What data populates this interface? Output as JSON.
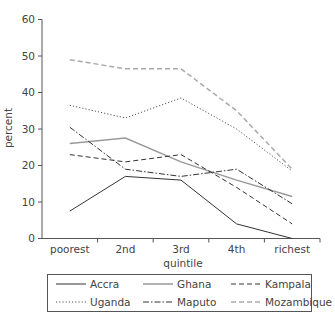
{
  "chart_data": {
    "type": "line",
    "title": "",
    "xlabel": "quintile",
    "ylabel": "percent",
    "ylim": [
      0,
      60
    ],
    "yticks": [
      0,
      10,
      20,
      30,
      40,
      50,
      60
    ],
    "grid": false,
    "legend_position": "bottom",
    "categories": [
      "poorest",
      "2nd",
      "3rd",
      "4th",
      "richest"
    ],
    "series": [
      {
        "name": "Accra",
        "values": [
          7.5,
          17,
          16,
          4,
          0
        ],
        "color": "#333333",
        "dash": "solid"
      },
      {
        "name": "Ghana",
        "values": [
          26,
          27.5,
          21,
          16,
          11.5
        ],
        "color": "#999999",
        "dash": "solid"
      },
      {
        "name": "Kampala",
        "values": [
          23,
          21,
          23,
          14,
          4
        ],
        "color": "#333333",
        "dash": "dashed"
      },
      {
        "name": "Uganda",
        "values": [
          36.5,
          33,
          38.5,
          30,
          18.5
        ],
        "color": "#555555",
        "dash": "dotted"
      },
      {
        "name": "Maputo",
        "values": [
          30.5,
          19,
          17,
          19,
          9.5
        ],
        "color": "#333333",
        "dash": "dashdot"
      },
      {
        "name": "Mozambique",
        "values": [
          49,
          46.5,
          46.5,
          35,
          19
        ],
        "color": "#aaaaaa",
        "dash": "dashed"
      }
    ]
  },
  "legend": {
    "items": [
      "Accra",
      "Ghana",
      "Kampala",
      "Uganda",
      "Maputo",
      "Mozambique"
    ]
  }
}
